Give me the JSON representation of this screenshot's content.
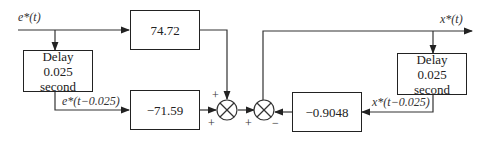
{
  "signals": {
    "input": "e*(t)",
    "input_delayed": "e*(t−0.025)",
    "output": "x*(t)",
    "output_delayed": "x*(t−0.025)"
  },
  "blocks": {
    "gain_top": "74.72",
    "gain_bottom": "−71.59",
    "gain_feedback": "−0.9048",
    "delay_input": {
      "line1": "Delay",
      "line2": "0.025 second"
    },
    "delay_output": {
      "line1": "Delay",
      "line2": "0.025 second"
    }
  },
  "summers": {
    "sum1_signs": {
      "top": "+",
      "left": "+"
    },
    "sum2_signs": {
      "left": "+",
      "right": "−"
    }
  }
}
